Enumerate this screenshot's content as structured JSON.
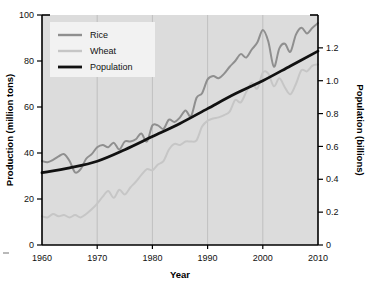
{
  "chart_data": {
    "type": "line",
    "title": "",
    "xlabel": "Year",
    "ylabel": "Production (million tons)",
    "y2label": "Population (billions)",
    "xlim": [
      1960,
      2010
    ],
    "ylim": [
      0,
      100
    ],
    "y2lim": [
      0,
      1.4
    ],
    "grid": true,
    "grid_axis": "x",
    "legend_position": "top-left",
    "x_ticks": [
      1960,
      1970,
      1980,
      1990,
      2000,
      2010
    ],
    "x_tick_labels": [
      "1960",
      "1970",
      "1980",
      "1990",
      "2000",
      "2010"
    ],
    "y_ticks": [
      0,
      20,
      40,
      60,
      80,
      100
    ],
    "y_tick_labels": [
      "0",
      "20",
      "40",
      "60",
      "80",
      "100"
    ],
    "y2_ticks": [
      0,
      0.2,
      0.4,
      0.6,
      0.8,
      1.0,
      1.2
    ],
    "y2_tick_labels": [
      "0",
      "0.2",
      "0.4",
      "0.6",
      "0.8",
      "1.0",
      "1.2"
    ],
    "series": [
      {
        "name": "Rice",
        "axis": "left",
        "color": "#8f8f8f",
        "width": 2.0,
        "unit": "million tons",
        "x": [
          1960,
          1961,
          1962,
          1963,
          1964,
          1965,
          1966,
          1967,
          1968,
          1969,
          1970,
          1971,
          1972,
          1973,
          1974,
          1975,
          1976,
          1977,
          1978,
          1979,
          1980,
          1981,
          1982,
          1983,
          1984,
          1985,
          1986,
          1987,
          1988,
          1989,
          1990,
          1991,
          1992,
          1993,
          1994,
          1995,
          1996,
          1997,
          1998,
          1999,
          2000,
          2001,
          2002,
          2003,
          2004,
          2005,
          2006,
          2007,
          2008,
          2009,
          2010
        ],
        "values": [
          36.5,
          36.0,
          37.0,
          38.5,
          39.5,
          36.5,
          31.5,
          33.0,
          37.5,
          39.5,
          42.5,
          43.5,
          42.5,
          44.5,
          41.5,
          45.0,
          45.0,
          46.0,
          48.5,
          45.0,
          52.0,
          52.0,
          50.5,
          54.5,
          53.5,
          55.5,
          58.5,
          56.0,
          64.0,
          66.0,
          72.0,
          73.5,
          72.5,
          74.5,
          77.5,
          80.0,
          83.0,
          81.5,
          85.0,
          88.0,
          93.5,
          88.5,
          77.5,
          85.5,
          87.5,
          84.0,
          91.5,
          94.5,
          92.0,
          94.5,
          96.5
        ]
      },
      {
        "name": "Wheat",
        "axis": "left",
        "color": "#c6c6c6",
        "width": 2.0,
        "unit": "million tons",
        "x": [
          1960,
          1961,
          1962,
          1963,
          1964,
          1965,
          1966,
          1967,
          1968,
          1969,
          1970,
          1971,
          1972,
          1973,
          1974,
          1975,
          1976,
          1977,
          1978,
          1979,
          1980,
          1981,
          1982,
          1983,
          1984,
          1985,
          1986,
          1987,
          1988,
          1989,
          1990,
          1991,
          1992,
          1993,
          1994,
          1995,
          1996,
          1997,
          1998,
          1999,
          2000,
          2001,
          2002,
          2003,
          2004,
          2005,
          2006,
          2007,
          2008,
          2009,
          2010
        ],
        "values": [
          12.5,
          12.0,
          13.5,
          12.5,
          13.0,
          12.0,
          13.0,
          12.0,
          13.5,
          15.5,
          18.0,
          21.0,
          23.5,
          20.5,
          24.0,
          22.0,
          25.0,
          27.5,
          30.5,
          33.0,
          32.5,
          35.0,
          36.5,
          41.5,
          44.0,
          43.5,
          45.0,
          45.0,
          45.5,
          51.5,
          54.0,
          55.0,
          55.5,
          56.5,
          58.0,
          63.0,
          62.0,
          66.5,
          70.5,
          68.0,
          75.0,
          74.5,
          69.0,
          72.5,
          68.5,
          65.5,
          70.0,
          76.0,
          75.5,
          78.0,
          78.5
        ]
      },
      {
        "name": "Population",
        "axis": "right",
        "color": "#111111",
        "width": 2.8,
        "unit": "billions",
        "x": [
          1960,
          1965,
          1970,
          1975,
          1980,
          1985,
          1990,
          1995,
          2000,
          2005,
          2010
        ],
        "values": [
          0.44,
          0.47,
          0.51,
          0.58,
          0.66,
          0.74,
          0.83,
          0.92,
          1.0,
          1.09,
          1.18
        ]
      }
    ],
    "legend_entries": [
      {
        "label": "Rice",
        "color": "#8f8f8f"
      },
      {
        "label": "Wheat",
        "color": "#c6c6c6"
      },
      {
        "label": "Population",
        "color": "#111111"
      }
    ]
  }
}
